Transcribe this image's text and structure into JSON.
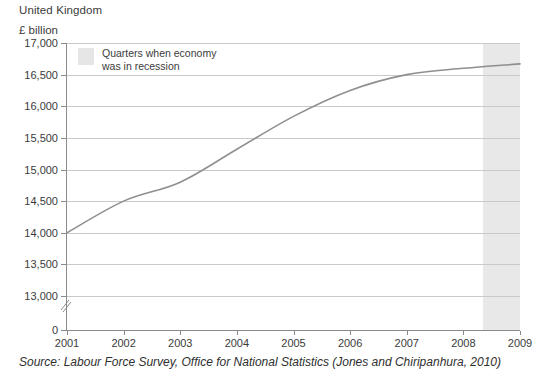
{
  "header": {
    "title": "United Kingdom",
    "unit_label": "£ billion"
  },
  "legend": {
    "label": "Quarters when economy\nwas in recession",
    "swatch_color": "#e6e6e6",
    "position": "inside-top-left"
  },
  "source": {
    "text": "Source: Labour Force Survey, Office for National Statistics (Jones and Chiripanhura, 2010)"
  },
  "chart_data": {
    "type": "line",
    "title": "United Kingdom",
    "subtitle": "",
    "xlabel": "",
    "ylabel": "£ billion",
    "x": [
      2001,
      2002,
      2003,
      2004,
      2005,
      2006,
      2007,
      2008,
      2009
    ],
    "xtick_labels": [
      "2001",
      "2002",
      "2003",
      "2004",
      "2005",
      "2006",
      "2007",
      "2008",
      "2009"
    ],
    "xlim": [
      2001,
      2009
    ],
    "ytick_labels": [
      "0",
      "13,000",
      "13,500",
      "14,000",
      "14,500",
      "15,000",
      "15,500",
      "16,000",
      "16,500",
      "17,000"
    ],
    "ytick_values": [
      0,
      13000,
      13500,
      14000,
      14500,
      15000,
      15500,
      16000,
      16500,
      17000
    ],
    "ylim": [
      12750,
      17000
    ],
    "y_axis_break": true,
    "y_axis_break_between": [
      0,
      13000
    ],
    "grid": "horizontal",
    "line_color": "#8f8f8f",
    "series": [
      {
        "name": "Gross value added",
        "values": [
          14000,
          14500,
          14800,
          15320,
          15840,
          16250,
          16500,
          16600,
          16670
        ]
      }
    ],
    "shaded_regions": [
      {
        "label": "Quarters when economy was in recession",
        "x_start": 2008.35,
        "x_end": 2009,
        "color": "#e8e8e8"
      }
    ]
  }
}
